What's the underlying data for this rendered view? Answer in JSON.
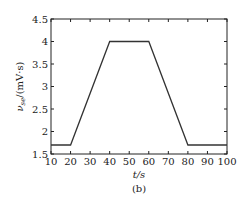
{
  "chart_data": {
    "type": "line",
    "title": "",
    "caption": "(b)",
    "xlabel": "t/s",
    "ylabel": "ν_se/(mV·s)",
    "xlim": [
      10,
      100
    ],
    "ylim": [
      1.5,
      4.5
    ],
    "xticks": [
      10,
      20,
      30,
      40,
      50,
      60,
      70,
      80,
      90,
      100
    ],
    "yticks": [
      1.5,
      2,
      2.5,
      3,
      3.5,
      4,
      4.5
    ],
    "xtick_labels": [
      "10",
      "20",
      "30",
      "40",
      "50",
      "60",
      "70",
      "80",
      "90",
      "100"
    ],
    "ytick_labels": [
      "1.5",
      "2",
      "2.5",
      "3",
      "3.5",
      "4",
      "4.5"
    ],
    "grid": false,
    "legend": null,
    "series": [
      {
        "name": "ν_se",
        "x": [
          10,
          20,
          40,
          60,
          80,
          100
        ],
        "y": [
          1.7,
          1.7,
          4.0,
          4.0,
          1.7,
          1.7
        ]
      }
    ]
  },
  "labels": {
    "x_axis": "t/s",
    "y_axis_main": "ν",
    "y_axis_sub": "se",
    "y_axis_unit": "/(mV·s)",
    "caption": "(b)"
  }
}
